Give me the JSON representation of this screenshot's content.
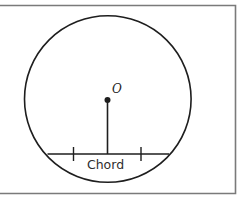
{
  "diagram": {
    "type": "circle-chord",
    "center_label": "O",
    "chord_label": "Chord",
    "colors": {
      "stroke": "#1e1e1e",
      "frame": "#7a7a7a",
      "text": "#2e2e2e",
      "background": "#ffffff"
    }
  }
}
